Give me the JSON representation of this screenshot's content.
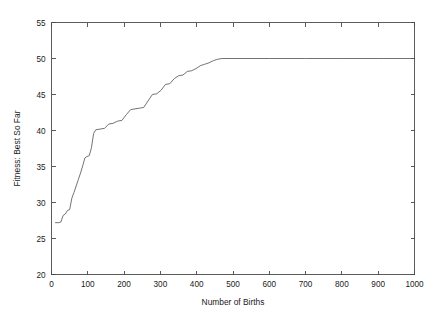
{
  "chart_data": {
    "type": "line",
    "title": "",
    "xlabel": "Number of Births",
    "ylabel": "Fitness: Best So Far",
    "xlim": [
      0,
      1000
    ],
    "ylim": [
      20,
      55
    ],
    "xticks": [
      0,
      100,
      200,
      300,
      400,
      500,
      600,
      700,
      800,
      900,
      1000
    ],
    "yticks": [
      20,
      25,
      30,
      35,
      40,
      45,
      50,
      55
    ],
    "grid": false,
    "legend": null,
    "line_color": "#5a5a5a",
    "background_color": "#ffffff",
    "axis_color": "#4a4a4a",
    "series": [
      {
        "name": "Best So Far",
        "x": [
          10,
          20,
          26,
          32,
          38,
          44,
          50,
          56,
          62,
          68,
          74,
          80,
          86,
          92,
          98,
          104,
          110,
          116,
          122,
          134,
          146,
          158,
          170,
          182,
          194,
          206,
          218,
          230,
          242,
          254,
          266,
          278,
          290,
          302,
          314,
          326,
          338,
          350,
          362,
          374,
          386,
          398,
          410,
          422,
          434,
          446,
          458,
          470,
          500,
          600,
          700,
          800,
          900,
          1000
        ],
        "y": [
          27.2,
          27.2,
          27.3,
          28.2,
          28.4,
          28.9,
          29.0,
          30.6,
          31.4,
          32.3,
          33.2,
          34.1,
          35.1,
          36.2,
          36.4,
          36.5,
          37.6,
          39.6,
          40.1,
          40.2,
          40.3,
          40.9,
          41.0,
          41.3,
          41.4,
          42.2,
          42.9,
          43.0,
          43.1,
          43.2,
          44.1,
          45.0,
          45.1,
          45.6,
          46.4,
          46.5,
          47.2,
          47.6,
          47.7,
          48.2,
          48.3,
          48.6,
          49.0,
          49.2,
          49.4,
          49.7,
          49.9,
          50.0,
          50.0,
          50.0,
          50.0,
          50.0,
          50.0,
          50.0
        ]
      }
    ]
  },
  "axes": {
    "x_label_text": "Number of Births",
    "y_label_text": "Fitness: Best So Far"
  }
}
